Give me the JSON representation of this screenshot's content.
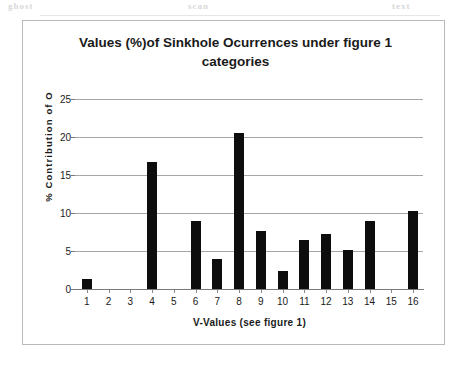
{
  "chart_data": {
    "type": "bar",
    "title": "Values (%)of Sinkhole Ocurrences under figure 1 categories",
    "xlabel": "V-Values (see figure 1)",
    "ylabel": "% Contribution of O",
    "categories": [
      "1",
      "2",
      "3",
      "4",
      "5",
      "6",
      "7",
      "8",
      "9",
      "10",
      "11",
      "12",
      "13",
      "14",
      "15",
      "16"
    ],
    "values": [
      1.3,
      0,
      0,
      16.7,
      0,
      9.0,
      3.9,
      20.5,
      7.6,
      2.4,
      6.4,
      7.2,
      5.1,
      8.9,
      0,
      10.2
    ],
    "ylim": [
      0,
      25
    ],
    "yticks": [
      0,
      5,
      10,
      15,
      20,
      25
    ],
    "ytick_labels": [
      "0",
      "5",
      "10",
      "15",
      "20",
      "25"
    ],
    "grid": "horizontal",
    "legend": "none",
    "bar_color": "#0d0d0d",
    "gridline_color": "#a6a6a6",
    "axis_color": "#7a7a7a",
    "background": "#ffffff"
  },
  "artifacts": {
    "ghost_left": "ghost",
    "ghost_mid": "scan",
    "ghost_right": "text"
  }
}
